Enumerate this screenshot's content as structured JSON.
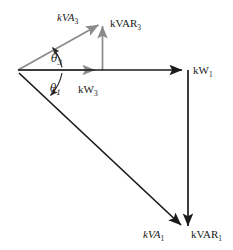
{
  "figure": {
    "background_color": "#ffffff",
    "colors": {
      "inner_triangle": "#8a8a8a",
      "outer_triangle": "#1a1a1a",
      "text": "#1a1a1a"
    },
    "labels": {
      "kva3": {
        "base": "kVA",
        "subscript": "3",
        "italic": true
      },
      "kvar3": {
        "base": "kVAR",
        "subscript": "3",
        "italic": false
      },
      "kw3": {
        "base": "kW",
        "subscript": "3",
        "italic": false
      },
      "kw1": {
        "base": "kW",
        "subscript": "1",
        "italic": false
      },
      "kva1": {
        "base": "kVA",
        "subscript": "1",
        "italic": true
      },
      "kvar1": {
        "base": "kVAR",
        "subscript": "1",
        "italic": false
      },
      "theta3": {
        "base": "θ",
        "subscript": "3",
        "italic": true
      },
      "theta1": {
        "base": "θ",
        "subscript": "1",
        "italic": true
      }
    },
    "geometry": {
      "origin": {
        "x": 18,
        "y": 70
      },
      "kw3_tip": {
        "x": 101,
        "y": 70
      },
      "kva3_tip": {
        "x": 103,
        "y": 21
      },
      "kw1_tip": {
        "x": 188,
        "y": 70
      },
      "kvar1_tip": {
        "x": 188,
        "y": 233
      },
      "kva1_tip": {
        "x": 186,
        "y": 231
      }
    }
  }
}
